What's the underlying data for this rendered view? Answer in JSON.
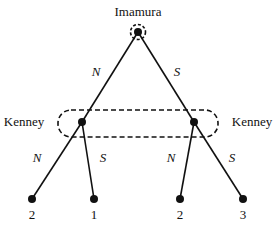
{
  "diagram": {
    "type": "game-tree",
    "root": {
      "player": "Imamura",
      "label_pos": [
        138,
        16
      ],
      "pos": [
        138,
        32
      ],
      "singleton_info_circle_radius": 7
    },
    "root_actions": [
      {
        "label": "N",
        "label_pos": [
          96,
          76
        ]
      },
      {
        "label": "S",
        "label_pos": [
          177,
          76
        ]
      }
    ],
    "second_movers": [
      {
        "player": "Kenney",
        "pos": [
          82,
          122
        ],
        "label_pos": [
          24,
          126
        ]
      },
      {
        "player": "Kenney",
        "pos": [
          194,
          122
        ],
        "label_pos": [
          252,
          126
        ]
      }
    ],
    "information_set": {
      "x": 58,
      "y": 110,
      "width": 160,
      "height": 27,
      "rx": 13
    },
    "leaf_actions": [
      {
        "label": "N",
        "label_pos": [
          37,
          162
        ]
      },
      {
        "label": "S",
        "label_pos": [
          103,
          162
        ]
      },
      {
        "label": "N",
        "label_pos": [
          171,
          162
        ]
      },
      {
        "label": "S",
        "label_pos": [
          232,
          162
        ]
      }
    ],
    "leaves": [
      {
        "pos": [
          32,
          199
        ],
        "payoff": "2",
        "payoff_pos": [
          32,
          219
        ]
      },
      {
        "pos": [
          94,
          199
        ],
        "payoff": "1",
        "payoff_pos": [
          94,
          219
        ]
      },
      {
        "pos": [
          180,
          199
        ],
        "payoff": "2",
        "payoff_pos": [
          180,
          219
        ]
      },
      {
        "pos": [
          243,
          199
        ],
        "payoff": "3",
        "payoff_pos": [
          243,
          219
        ]
      }
    ]
  }
}
